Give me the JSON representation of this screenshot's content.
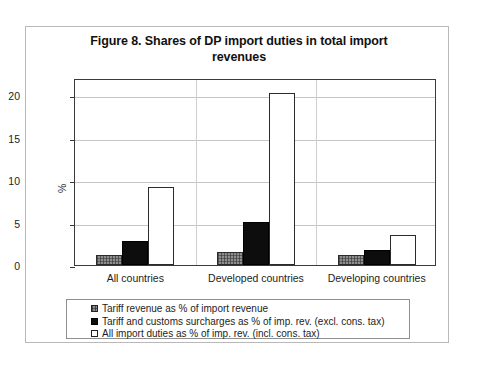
{
  "chart_data": {
    "type": "bar",
    "title": "Figure 8. Shares of DP import duties in total import revenues",
    "title_line1": "Figure 8. Shares of DP import duties in total import",
    "title_line2": "revenues",
    "xlabel": "",
    "ylabel": "%",
    "ylim": [
      0,
      22
    ],
    "yticks": [
      0,
      5,
      10,
      15,
      20
    ],
    "ytick_labels": [
      "0",
      "5",
      "10",
      "15",
      "20"
    ],
    "grid": true,
    "legend_position": "bottom",
    "categories": [
      "All countries",
      "Developed countries",
      "Developing countries"
    ],
    "series": [
      {
        "name": "Tariff revenue as % of import revenue",
        "values": [
          1.2,
          1.5,
          1.2
        ],
        "color": "#8e8e8e",
        "swatch": "gray-hatched"
      },
      {
        "name": "Tariff and customs surcharges  as % of imp. rev. (excl. cons. tax)",
        "values": [
          2.8,
          5.1,
          1.8
        ],
        "color": "#0d0d0d",
        "swatch": "solid-black"
      },
      {
        "name": "All import duties as % of imp. rev. (incl. cons. tax)",
        "values": [
          9.2,
          20.2,
          3.5
        ],
        "color": "#ffffff",
        "swatch": "white-outlined"
      }
    ]
  }
}
